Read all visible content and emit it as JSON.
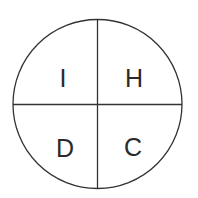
{
  "diagram": {
    "type": "quadrant-circle",
    "quadrants": {
      "top_left": "I",
      "top_right": "H",
      "bottom_left": "D",
      "bottom_right": "C"
    },
    "colors": {
      "stroke": "#333333",
      "text": "#2a2a2a",
      "background": "#ffffff"
    }
  }
}
